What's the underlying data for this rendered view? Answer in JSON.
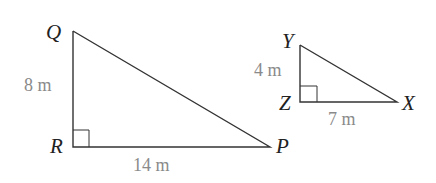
{
  "diagram": {
    "type": "similar right triangles",
    "triangles": [
      {
        "name": "QRP",
        "vertices": {
          "Q": "Q",
          "R": "R",
          "P": "P"
        },
        "right_angle_at": "R",
        "sides": {
          "QR": "8 m",
          "RP": "14 m"
        }
      },
      {
        "name": "YZX",
        "vertices": {
          "Y": "Y",
          "Z": "Z",
          "X": "X"
        },
        "right_angle_at": "Z",
        "sides": {
          "YZ": "4 m",
          "ZX": "7 m"
        }
      }
    ],
    "colors": {
      "lines": "#333333",
      "vertex_labels": "#222222",
      "measure_labels": "#8a8a8a"
    }
  }
}
